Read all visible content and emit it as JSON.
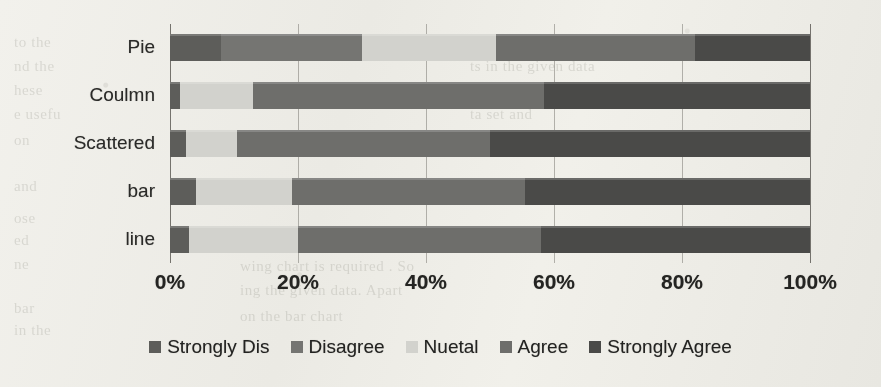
{
  "chart_data": {
    "type": "bar",
    "orientation": "horizontal",
    "stacked": "100%",
    "title": "",
    "xlabel": "",
    "ylabel": "",
    "xlim": [
      0,
      100
    ],
    "xticks": [
      "0%",
      "20%",
      "40%",
      "60%",
      "80%",
      "100%"
    ],
    "xtick_values": [
      0,
      20,
      40,
      60,
      80,
      100
    ],
    "grid": true,
    "legend_position": "bottom",
    "categories": [
      "Pie",
      "Coulmn",
      "Scattered",
      "bar",
      "line"
    ],
    "series": [
      {
        "name": "Strongly Dis",
        "color": "#5d5d5b",
        "values": [
          8,
          1.5,
          2.5,
          4,
          3
        ]
      },
      {
        "name": "Disagree",
        "color": "#757573",
        "values": [
          22,
          0,
          0,
          0,
          0
        ]
      },
      {
        "name": "Nuetal",
        "color": "#d3d3cf",
        "values": [
          21,
          11.5,
          8,
          15,
          17
        ]
      },
      {
        "name": "Agree",
        "color": "#6e6e6c",
        "values": [
          31,
          45.5,
          39.5,
          36.5,
          38
        ]
      },
      {
        "name": "Strongly Agree",
        "color": "#4a4a48",
        "values": [
          18,
          41.5,
          50,
          44.5,
          42
        ]
      }
    ]
  },
  "legend": {
    "marker": "square-swatch-icon",
    "items": [
      {
        "label": "Strongly Dis",
        "color": "#5d5d5b"
      },
      {
        "label": "Disagree",
        "color": "#757573"
      },
      {
        "label": "Nuetal",
        "color": "#d3d3cf"
      },
      {
        "label": "Agree",
        "color": "#6e6e6c"
      },
      {
        "label": "Strongly Agree",
        "color": "#4a4a48"
      }
    ]
  },
  "scan_bleed_text": [
    {
      "text": "to the",
      "x": 14,
      "y": 34
    },
    {
      "text": "nd the",
      "x": 14,
      "y": 58
    },
    {
      "text": "hese",
      "x": 14,
      "y": 82
    },
    {
      "text": "e usefu",
      "x": 14,
      "y": 106
    },
    {
      "text": "on",
      "x": 14,
      "y": 132
    },
    {
      "text": "and",
      "x": 14,
      "y": 178
    },
    {
      "text": "ose",
      "x": 14,
      "y": 210
    },
    {
      "text": "ed",
      "x": 14,
      "y": 232
    },
    {
      "text": "ne",
      "x": 14,
      "y": 256
    },
    {
      "text": "bar",
      "x": 14,
      "y": 300
    },
    {
      "text": "in the",
      "x": 14,
      "y": 322
    },
    {
      "text": "sion of the data with",
      "x": 430,
      "y": 34
    },
    {
      "text": "ts in the given data",
      "x": 470,
      "y": 58
    },
    {
      "text": "ble to understand",
      "x": 470,
      "y": 82
    },
    {
      "text": "ta set and",
      "x": 470,
      "y": 106
    },
    {
      "text": "ar",
      "x": 560,
      "y": 130
    },
    {
      "text": "ta",
      "x": 540,
      "y": 176
    },
    {
      "text": "wing chart is required . So",
      "x": 240,
      "y": 258
    },
    {
      "text": "ing the given data. Apart",
      "x": 240,
      "y": 282
    },
    {
      "text": "on the bar chart",
      "x": 240,
      "y": 308
    }
  ]
}
